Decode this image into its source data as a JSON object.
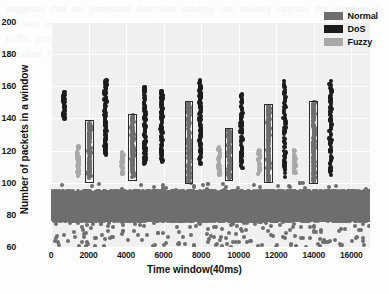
{
  "chart_data": {
    "type": "scatter",
    "title": "",
    "xlabel": "Time window(40ms)",
    "ylabel": "Number of packets in a window",
    "xlim": [
      0,
      17000
    ],
    "ylim": [
      60,
      200
    ],
    "xticks": [
      0,
      2000,
      4000,
      6000,
      8000,
      10000,
      12000,
      14000,
      16000
    ],
    "yticks": [
      60,
      80,
      100,
      120,
      140,
      160,
      180,
      200
    ],
    "grid": true,
    "legend_position": "top-right",
    "legend": [
      {
        "name": "Normal",
        "color": "#6e6e6e"
      },
      {
        "name": "DoS",
        "color": "#1c1c1c"
      },
      {
        "name": "Fuzzy",
        "color": "#a8a8a8"
      }
    ],
    "series": [
      {
        "name": "Normal",
        "color": "#6e6e6e",
        "description": "Dense continuous baseline band of packet counts between 76 and 95 across the entire time range, with sparse low outliers down to 60; plus tall vertical attack-window clusters highlighted by annotation boxes.",
        "baseline_band": {
          "x_start": 0,
          "x_end": 17000,
          "y_low": 76,
          "y_high": 95
        },
        "clusters": [
          {
            "x": 2050,
            "y_min": 103,
            "y_max": 137,
            "n": 46
          },
          {
            "x": 4350,
            "y_min": 104,
            "y_max": 142,
            "n": 48
          },
          {
            "x": 7350,
            "y_min": 101,
            "y_max": 150,
            "n": 52
          },
          {
            "x": 9500,
            "y_min": 103,
            "y_max": 132,
            "n": 40
          },
          {
            "x": 11600,
            "y_min": 102,
            "y_max": 148,
            "n": 54
          },
          {
            "x": 14000,
            "y_min": 101,
            "y_max": 150,
            "n": 52
          }
        ]
      },
      {
        "name": "DoS",
        "color": "#1c1c1c",
        "description": "Tall dense vertical clusters of high packet counts occurring in discrete attack bursts.",
        "clusters": [
          {
            "x": 700,
            "y_min": 140,
            "y_max": 157,
            "n": 22
          },
          {
            "x": 2900,
            "y_min": 118,
            "y_max": 164,
            "n": 44
          },
          {
            "x": 5000,
            "y_min": 112,
            "y_max": 160,
            "n": 40
          },
          {
            "x": 5900,
            "y_min": 113,
            "y_max": 157,
            "n": 36
          },
          {
            "x": 7950,
            "y_min": 112,
            "y_max": 163,
            "n": 46
          },
          {
            "x": 10150,
            "y_min": 110,
            "y_max": 155,
            "n": 34
          },
          {
            "x": 12450,
            "y_min": 104,
            "y_max": 163,
            "n": 30
          },
          {
            "x": 14900,
            "y_min": 105,
            "y_max": 163,
            "n": 34
          }
        ]
      },
      {
        "name": "Fuzzy",
        "color": "#a8a8a8",
        "description": "Short light-gray vertical clusters of moderately elevated packet counts preceding each highlighted normal window.",
        "clusters": [
          {
            "x": 1450,
            "y_min": 105,
            "y_max": 122,
            "n": 16
          },
          {
            "x": 3800,
            "y_min": 105,
            "y_max": 119,
            "n": 15
          },
          {
            "x": 8950,
            "y_min": 105,
            "y_max": 122,
            "n": 16
          },
          {
            "x": 11100,
            "y_min": 106,
            "y_max": 120,
            "n": 15
          },
          {
            "x": 13000,
            "y_min": 106,
            "y_max": 120,
            "n": 15
          }
        ]
      }
    ],
    "annotation_boxes": [
      {
        "x_center": 2050,
        "x_half_width": 220,
        "y_min": 100,
        "y_max": 139
      },
      {
        "x_center": 4350,
        "x_half_width": 220,
        "y_min": 101,
        "y_max": 143
      },
      {
        "x_center": 7350,
        "x_half_width": 230,
        "y_min": 99,
        "y_max": 151
      },
      {
        "x_center": 9500,
        "x_half_width": 220,
        "y_min": 101,
        "y_max": 134
      },
      {
        "x_center": 11600,
        "x_half_width": 230,
        "y_min": 100,
        "y_max": 149
      },
      {
        "x_center": 14000,
        "x_half_width": 230,
        "y_min": 99,
        "y_max": 151
      }
    ]
  },
  "background_text": "suggests that the proposed detection scheme can reliably capture the number of packets observed within each sliding time window and that the injected attack traffic produces clearly separable patterns when compared against the normal baseline traffic for the CAN bus dataset"
}
